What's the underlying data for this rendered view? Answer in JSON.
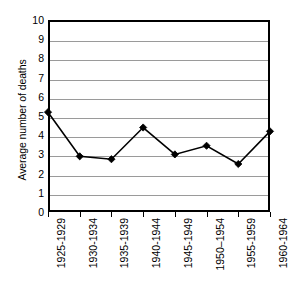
{
  "chart_data": {
    "type": "line",
    "title": "",
    "xlabel": "",
    "ylabel": "Average number of deaths",
    "categories": [
      "1925-1929",
      "1930-1934",
      "1935-1939",
      "1940-1944",
      "1945-1949",
      "1950–1954",
      "1955-1959",
      "1960-1964"
    ],
    "values": [
      5.2,
      2.9,
      2.75,
      4.4,
      3.0,
      3.45,
      2.5,
      4.2
    ],
    "ylim": [
      0,
      10
    ],
    "yticks": [
      0,
      1,
      2,
      3,
      4,
      5,
      6,
      7,
      8,
      9,
      10
    ],
    "ytick_labels": [
      "0",
      "1",
      "2",
      "3",
      "4",
      "5",
      "6",
      "7",
      "8",
      "9",
      "10"
    ],
    "grid": "horizontal",
    "legend": "none",
    "marker": "diamond",
    "series_color": "#000000",
    "gridline_color": "#9a9a9a",
    "axis_color": "#000000",
    "background_color": "#ffffff"
  }
}
